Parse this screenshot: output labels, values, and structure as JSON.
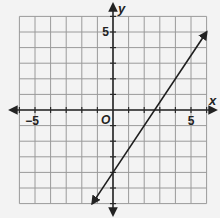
{
  "chart_data": {
    "type": "line",
    "title": "",
    "xlabel": "x",
    "ylabel": "y",
    "origin_label": "O",
    "xlim": [
      -6,
      6
    ],
    "ylim": [
      -6,
      6
    ],
    "grid": true,
    "grid_step": 1,
    "x_tick_labels": [
      {
        "value": -5,
        "label": "−5"
      },
      {
        "value": 5,
        "label": "5"
      }
    ],
    "y_tick_labels": [
      {
        "value": 5,
        "label": "5"
      }
    ],
    "series": [
      {
        "name": "line",
        "equation": "y = 1.5x - 4",
        "slope": 1.5,
        "intercept": -4,
        "x_intercept": 2.67,
        "points": [
          {
            "x": -1.33,
            "y": -6
          },
          {
            "x": 0,
            "y": -4
          },
          {
            "x": 2.67,
            "y": 0
          },
          {
            "x": 6,
            "y": 5
          }
        ],
        "arrows": "both"
      }
    ]
  },
  "colors": {
    "background": "#f3f3f3",
    "grid": "#9a9a9a",
    "axis": "#2a2a2a",
    "line": "#1e1e1e"
  }
}
